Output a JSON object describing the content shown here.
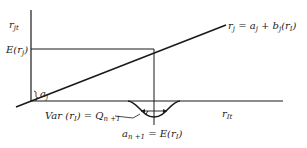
{
  "diagram": {
    "y_axis_label": "r",
    "y_axis_sub": "jt",
    "x_axis_label": "r",
    "x_axis_sub": "It",
    "expected_rj_label_prefix": "E(r",
    "expected_rj_label_sub": "j",
    "expected_rj_label_suffix": ")",
    "intercept_label": "a",
    "intercept_sub": "j",
    "regression_label": {
      "lhs": "r",
      "lhs_sub": "j",
      "eq": " = a",
      "a_sub": "j",
      "plus": " + b",
      "b_sub": "j",
      "tail_open": "(r",
      "tail_sub": "I",
      "tail_close": ")"
    },
    "variance_label": {
      "prefix": "Var (r",
      "sub": "I",
      "mid": ") = Q",
      "q_sub": "n +1"
    },
    "mean_label": {
      "prefix": "a",
      "sub": "n +1",
      "mid": " = E(r",
      "e_sub": "I",
      "suffix": ")"
    }
  },
  "colors": {
    "line": "#1a1a1a",
    "text": "#222222",
    "background": "#ffffff"
  }
}
